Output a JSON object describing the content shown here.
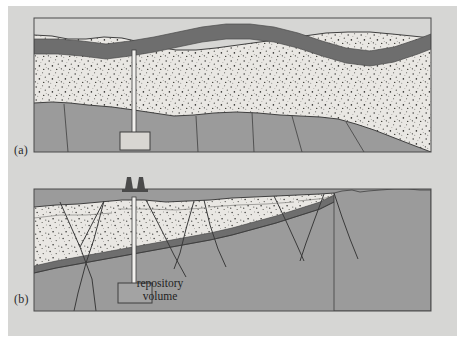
{
  "figure": {
    "background_color": "#ffffff",
    "plate_color": "#d6d6d4",
    "panels": [
      {
        "tag": "(a)",
        "name": "stable-flat-lying-strata",
        "description": "Gently folded undeformed sedimentary sequence with a vertical borehole to a repository volume"
      },
      {
        "tag": "(b)",
        "name": "faulted-tilted-strata",
        "description": "Tectonically faulted and tilted sequence with drilling derricks over a repository volume"
      }
    ]
  },
  "labels": {
    "panel_a": "(a)",
    "panel_b": "(b)",
    "repository_line1": "repository",
    "repository_line2": "volume"
  },
  "colors": {
    "sandstone_light": "#e9e7e3",
    "speckle_dark": "#3a3a38",
    "clay_band_dark": "#6e6e6e",
    "basement_rock": "#9b9b9b",
    "basement_rock_shade": "#919191",
    "outline": "#3f3f3f",
    "borehole_white": "#f2f1ee",
    "derrick_dark": "#4a4a4a",
    "plate": "#d6d6d4"
  },
  "geology": {
    "layers": [
      {
        "id": "overburden-sandstone",
        "label": "speckled sandstone",
        "fill": "#e9e7e3"
      },
      {
        "id": "clay-band",
        "label": "dark clay marker band",
        "fill": "#6e6e6e"
      },
      {
        "id": "basement",
        "label": "basement rock",
        "fill": "#9b9b9b"
      }
    ],
    "panel_a": {
      "fault_count": 5,
      "borehole_depth_label": "repository volume",
      "deformation": "undeformed"
    },
    "panel_b": {
      "fault_count": 9,
      "derrick_count": 2,
      "deformation": "normal faulting, tilted wedge"
    }
  }
}
